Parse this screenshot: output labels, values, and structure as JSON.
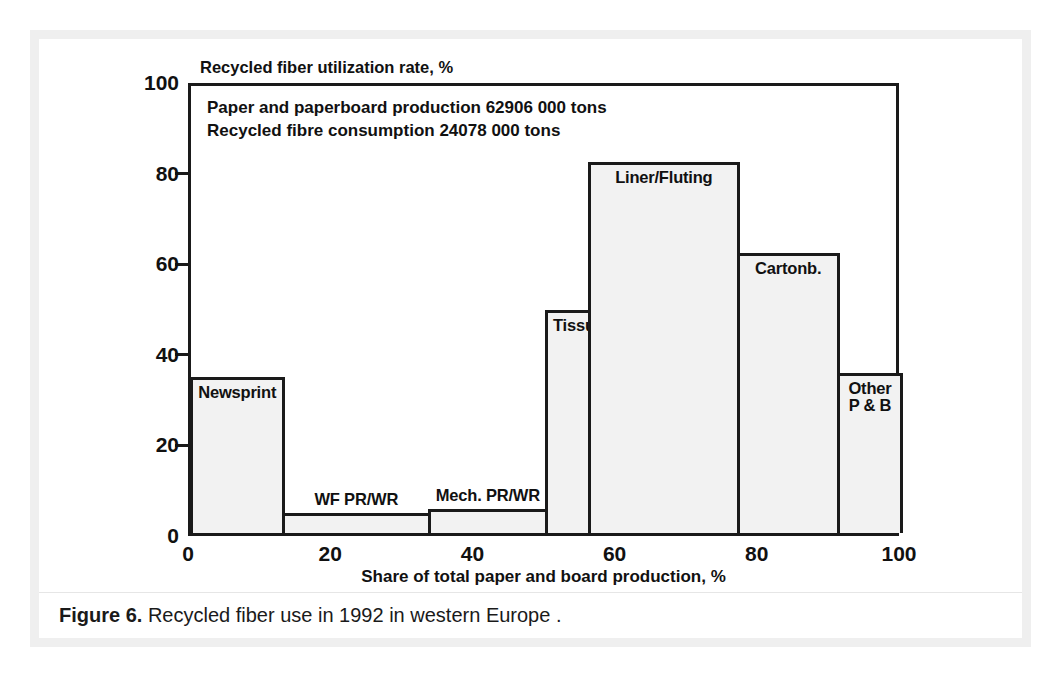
{
  "figure": {
    "caption_label": "Figure 6.",
    "caption_text": "Recycled fiber use in 1992 in western Europe ."
  },
  "chart_data": {
    "type": "bar",
    "title": "Recycled  fiber utilization rate, %",
    "xlabel": "Share of total paper and board production, %",
    "ylabel": "Recycled  fiber utilization rate, %",
    "xlim": [
      0,
      100
    ],
    "ylim": [
      0,
      100
    ],
    "grid": false,
    "legend": "none",
    "variable_width_bars": true,
    "annotations": [
      "Paper and paperboard production 62906 000 tons",
      "Recycled fibre consumption 24078 000 tons"
    ],
    "xticks": [
      0,
      20,
      40,
      60,
      80,
      100
    ],
    "xtick_labels": [
      "0",
      "20",
      "40",
      "60",
      "80",
      "100"
    ],
    "yticks": [
      0,
      20,
      40,
      60,
      80,
      100
    ],
    "ytick_labels": [
      "0",
      "20",
      "40",
      "60",
      "80",
      "100"
    ],
    "categories": [
      "Newsprint",
      "WF PR/WR",
      "Mech. PR/WR",
      "Tissue",
      "Liner/Fluting",
      "Cartonb.",
      "Other P & B"
    ],
    "values": [
      34,
      4,
      5,
      49,
      81.5,
      61.5,
      35
    ],
    "bars": [
      {
        "label": "Newsprint",
        "x_start": 0,
        "x_end": 13,
        "value": 34
      },
      {
        "label": "WF PR/WR",
        "x_start": 13,
        "x_end": 33.5,
        "value": 4
      },
      {
        "label": "Mech. PR/WR",
        "x_start": 33.5,
        "x_end": 50,
        "value": 5
      },
      {
        "label": "Tissue",
        "x_start": 50,
        "x_end": 56,
        "value": 49
      },
      {
        "label": "Liner/Fluting",
        "x_start": 56,
        "x_end": 77,
        "value": 81.5
      },
      {
        "label": "Cartonb.",
        "x_start": 77,
        "x_end": 91,
        "value": 61.5
      },
      {
        "label": "Other P & B",
        "x_start": 91,
        "x_end": 100,
        "value": 35
      }
    ],
    "bar_label_lines": [
      [
        "Newsprint"
      ],
      [
        "WF PR/WR"
      ],
      [
        "Mech. PR/WR"
      ],
      [
        "Tissue"
      ],
      [
        "Liner/Fluting"
      ],
      [
        "Cartonb."
      ],
      [
        "Other",
        "P & B"
      ]
    ],
    "colors": {
      "bar_fill": "#f2f2f2",
      "bar_stroke": "#1a1a1a",
      "axis": "#1a1a1a",
      "text": "#111111",
      "frame": "#efefef",
      "background": "#ffffff"
    }
  }
}
